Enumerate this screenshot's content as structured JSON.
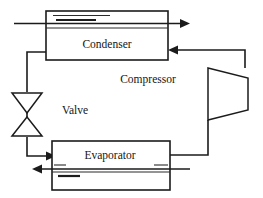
{
  "diagram": {
    "type": "process-flow-diagram",
    "background_color": "#ffffff",
    "line_color": "#1b1b1b",
    "components": {
      "condenser": {
        "label": "Condenser",
        "shape": "rectangle-with-internal-tube",
        "x": 46,
        "y": 11,
        "width": 122,
        "height": 49
      },
      "evaporator": {
        "label": "Evaporator",
        "shape": "rectangle-with-internal-tube",
        "x": 52,
        "y": 141,
        "width": 118,
        "height": 49
      },
      "compressor": {
        "label": "Compressor",
        "shape": "trapezoid",
        "x": 208,
        "y": 68,
        "width": 40,
        "height": 52
      },
      "valve": {
        "label": "Valve",
        "shape": "double-triangle-expansion-valve",
        "x": 11,
        "y": 92,
        "width": 32,
        "height": 45
      }
    },
    "flow_arrows": [
      {
        "name": "condenser-coolant-outlet",
        "direction": "right",
        "at": "condenser-top-right"
      },
      {
        "name": "compressor-to-condenser",
        "direction": "left",
        "at": "condenser-right"
      },
      {
        "name": "valve-to-evaporator",
        "direction": "right",
        "at": "evaporator-left"
      },
      {
        "name": "evaporator-coolant-outlet",
        "direction": "left",
        "at": "evaporator-bottom-left"
      }
    ],
    "connections": [
      {
        "from": "condenser",
        "to": "valve",
        "path": "condenser-bottom-left to left riser down to valve-top"
      },
      {
        "from": "valve",
        "to": "evaporator",
        "path": "valve-bottom down then right into evaporator-left"
      },
      {
        "from": "evaporator",
        "to": "compressor",
        "path": "evaporator-right then right and up to compressor-bottom"
      },
      {
        "from": "compressor",
        "to": "condenser",
        "path": "compressor-top up then left into condenser-right"
      }
    ]
  }
}
